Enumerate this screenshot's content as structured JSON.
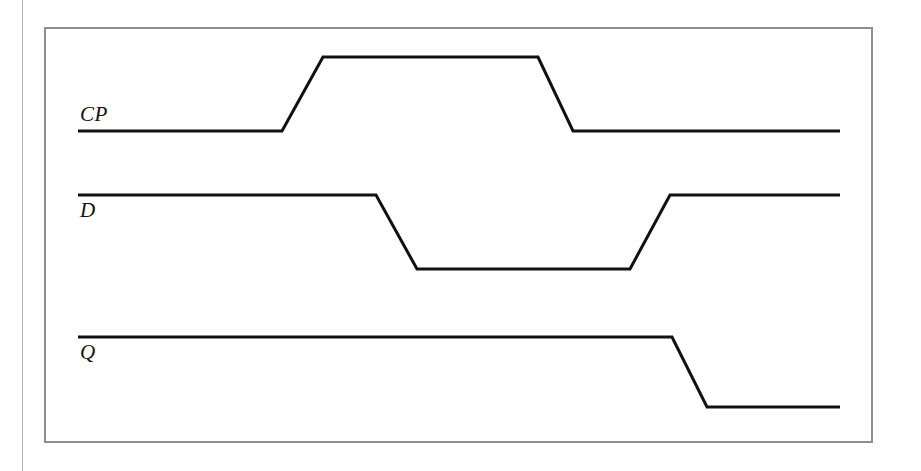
{
  "figure": {
    "kind": "timing-diagram",
    "background_color": "#ffffff",
    "frame": {
      "color": "#8e8e8e",
      "x": 44,
      "y": 27,
      "width": 829,
      "height": 416
    },
    "page_edge": {
      "color": "#b4b4b4",
      "x": 22
    }
  },
  "chart_data": {
    "type": "line",
    "title": "",
    "xlabel": "",
    "ylabel": "",
    "grid": false,
    "legend": "none",
    "trace_color": "#111111",
    "trace_width": 3,
    "x_start": 78,
    "x_end": 840,
    "signals": [
      {
        "name": "CP",
        "label": "CP",
        "label_position": "above-line",
        "label_x": 80,
        "label_y": 104,
        "idle_level": "low",
        "high_y": 57,
        "low_y": 131,
        "points": [
          [
            78,
            131
          ],
          [
            282,
            131
          ],
          [
            323,
            57
          ],
          [
            538,
            57
          ],
          [
            573,
            131
          ],
          [
            840,
            131
          ]
        ],
        "transitions": [
          {
            "edge": "rising",
            "start_x": 282,
            "end_x": 323
          },
          {
            "edge": "falling",
            "start_x": 538,
            "end_x": 573
          }
        ]
      },
      {
        "name": "D",
        "label": "D",
        "label_position": "below-line",
        "label_x": 80,
        "label_y": 200,
        "idle_level": "high",
        "high_y": 195,
        "low_y": 269,
        "points": [
          [
            78,
            195
          ],
          [
            376,
            195
          ],
          [
            417,
            269
          ],
          [
            630,
            269
          ],
          [
            670,
            195
          ],
          [
            840,
            195
          ]
        ],
        "transitions": [
          {
            "edge": "falling",
            "start_x": 376,
            "end_x": 417
          },
          {
            "edge": "rising",
            "start_x": 630,
            "end_x": 670
          }
        ]
      },
      {
        "name": "Q",
        "label": "Q",
        "label_position": "below-line",
        "label_x": 80,
        "label_y": 342,
        "idle_level": "high",
        "high_y": 337,
        "low_y": 407,
        "points": [
          [
            78,
            337
          ],
          [
            672,
            337
          ],
          [
            707,
            407
          ],
          [
            840,
            407
          ]
        ],
        "transitions": [
          {
            "edge": "falling",
            "start_x": 672,
            "end_x": 707
          }
        ]
      }
    ]
  }
}
